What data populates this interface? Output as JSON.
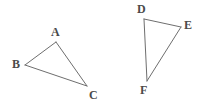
{
  "figure": {
    "type": "geometry-diagram",
    "background_color": "#ffffff",
    "stroke_color": "#6e6e6e",
    "label_color": "#4a4a4a",
    "stroke_width": 1,
    "width": 203,
    "height": 111,
    "shapes": [
      {
        "name": "triangle-abc",
        "vertices": [
          {
            "label": "A",
            "x": 56,
            "y": 42,
            "label_x": 51,
            "label_y": 26
          },
          {
            "label": "B",
            "x": 25,
            "y": 65,
            "label_x": 12,
            "label_y": 58
          },
          {
            "label": "C",
            "x": 87,
            "y": 86,
            "label_x": 89,
            "label_y": 89
          }
        ],
        "edges": [
          {
            "from": "A",
            "to": "B"
          },
          {
            "from": "B",
            "to": "C"
          },
          {
            "from": "C",
            "to": "A"
          }
        ]
      },
      {
        "name": "triangle-def",
        "vertices": [
          {
            "label": "D",
            "x": 144,
            "y": 19,
            "label_x": 137,
            "label_y": 3
          },
          {
            "label": "E",
            "x": 181,
            "y": 27,
            "label_x": 184,
            "label_y": 19
          },
          {
            "label": "F",
            "x": 147,
            "y": 81,
            "label_x": 140,
            "label_y": 84
          }
        ],
        "edges": [
          {
            "from": "D",
            "to": "E"
          },
          {
            "from": "E",
            "to": "F"
          },
          {
            "from": "F",
            "to": "D"
          }
        ]
      }
    ]
  }
}
